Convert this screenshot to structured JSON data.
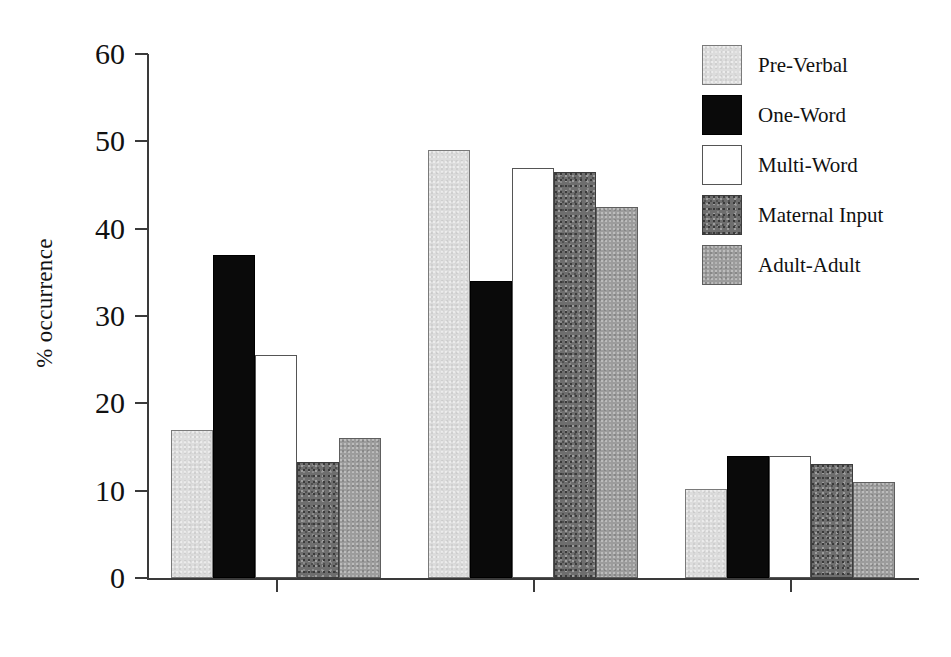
{
  "chart_data": {
    "type": "bar",
    "title": "",
    "xlabel": "",
    "ylabel": "% occurrence",
    "categories": [
      "bilabials",
      "alveolars",
      "velars"
    ],
    "series": [
      {
        "name": "Pre-Verbal",
        "values": [
          17.0,
          49.0,
          10.2
        ],
        "swatch": "light-speckle"
      },
      {
        "name": "One-Word",
        "values": [
          37.0,
          34.0,
          14.0
        ],
        "swatch": "black"
      },
      {
        "name": "Multi-Word",
        "values": [
          25.5,
          47.0,
          14.0
        ],
        "swatch": "white"
      },
      {
        "name": "Maternal Input",
        "values": [
          13.3,
          46.5,
          13.0
        ],
        "swatch": "dark-mottled"
      },
      {
        "name": "Adult-Adult",
        "values": [
          16.0,
          42.5,
          11.0
        ],
        "swatch": "gray-speckle"
      }
    ],
    "ylim": [
      0,
      60
    ],
    "yticks": [
      0,
      10,
      20,
      30,
      40,
      50,
      60
    ],
    "ytick_labels": [
      "0",
      "10",
      "20",
      "30",
      "40",
      "50",
      "60"
    ],
    "grid": false,
    "legend_position": "right-top"
  },
  "colors": {
    "axis": "#3a3a3a",
    "text": "#111111",
    "background": "#ffffff",
    "series_black": "#0a0a0a",
    "series_white": "#ffffff",
    "series_light": "#dcdcdc",
    "series_dark": "#6e6e6e",
    "series_gray": "#9c9c9c"
  }
}
